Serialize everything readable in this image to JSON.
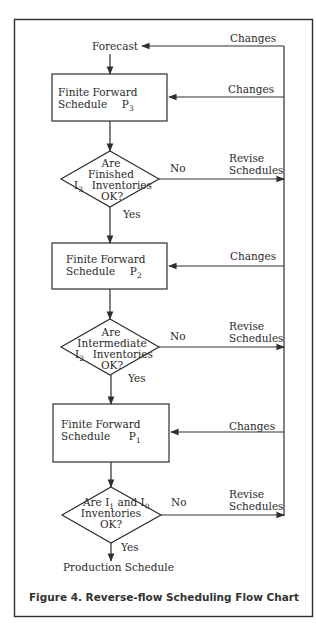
{
  "figure": {
    "caption": "Figure 4. Reverse-flow Scheduling Flow Chart",
    "colors": {
      "line": "#2e2e2e",
      "text": "#2a2a2a",
      "background": "#ffffff"
    }
  },
  "nodes": {
    "forecast": {
      "label": "Forecast"
    },
    "p3": {
      "line1": "Finite Forward",
      "line2": "Schedule",
      "symbol": "P",
      "subscript": "3"
    },
    "d1": {
      "line1": "Are",
      "line2": "Finished",
      "prefix_symbol": "I",
      "prefix_subscript": "3",
      "line3": "Inventories",
      "line4": "OK?"
    },
    "p2": {
      "line1": "Finite Forward",
      "line2": "Schedule",
      "symbol": "P",
      "subscript": "2"
    },
    "d2": {
      "line1": "Are",
      "line2": "Intermediate",
      "prefix_symbol": "I",
      "prefix_subscript": "2",
      "line3": "Inventories",
      "line4": "OK?"
    },
    "p1": {
      "line1": "Finite Forward",
      "line2": "Schedule",
      "symbol": "P",
      "subscript": "1"
    },
    "d3": {
      "line1_a": "Are ",
      "sym1": "I",
      "sub1": "1",
      "line1_b": " and ",
      "sym2": "I",
      "sub2": "0",
      "line2": "Inventories",
      "line3": "OK?"
    },
    "production": {
      "label": "Production Schedule"
    }
  },
  "edges": {
    "changes_forecast": "Changes",
    "changes_p3": "Changes",
    "changes_p2": "Changes",
    "changes_p1": "Changes",
    "d1_no": "No",
    "d1_yes": "Yes",
    "d1_revise_1": "Revise",
    "d1_revise_2": "Schedules",
    "d2_no": "No",
    "d2_yes": "Yes",
    "d2_revise_1": "Revise",
    "d2_revise_2": "Schedules",
    "d3_no": "No",
    "d3_yes": "Yes",
    "d3_revise_1": "Revise",
    "d3_revise_2": "Schedules"
  }
}
